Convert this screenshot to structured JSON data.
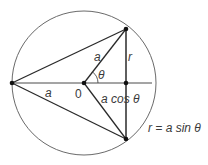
{
  "diagram": {
    "type": "geometry",
    "colors": {
      "circle": "#6a6a6a",
      "lines": "#2a2a2a",
      "points": "#111111",
      "text": "#3a3a3a"
    },
    "labels": {
      "radius_bottom": "a",
      "center": "0",
      "radius_slant": "a",
      "angle": "θ",
      "half_chord": "r",
      "adjacent": "a cos θ",
      "formula": "r = a sin θ"
    },
    "points": [
      {
        "name": "left",
        "x": 12,
        "y": 83
      },
      {
        "name": "center",
        "x": 84,
        "y": 83
      },
      {
        "name": "top",
        "x": 126,
        "y": 29
      },
      {
        "name": "foot",
        "x": 126,
        "y": 83
      },
      {
        "name": "bottom",
        "x": 126,
        "y": 139
      }
    ],
    "circle": {
      "cx": 84,
      "cy": 83,
      "r": 72
    }
  }
}
